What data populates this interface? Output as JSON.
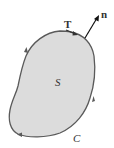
{
  "diagram": {
    "region_label": "S",
    "curve_label": "C",
    "tangent_label": "T",
    "normal_label": "n",
    "colors": {
      "region_fill": "#dcdcdc",
      "curve_stroke": "#5a5a5a",
      "vector_stroke": "#111111",
      "label": "#333333"
    }
  }
}
